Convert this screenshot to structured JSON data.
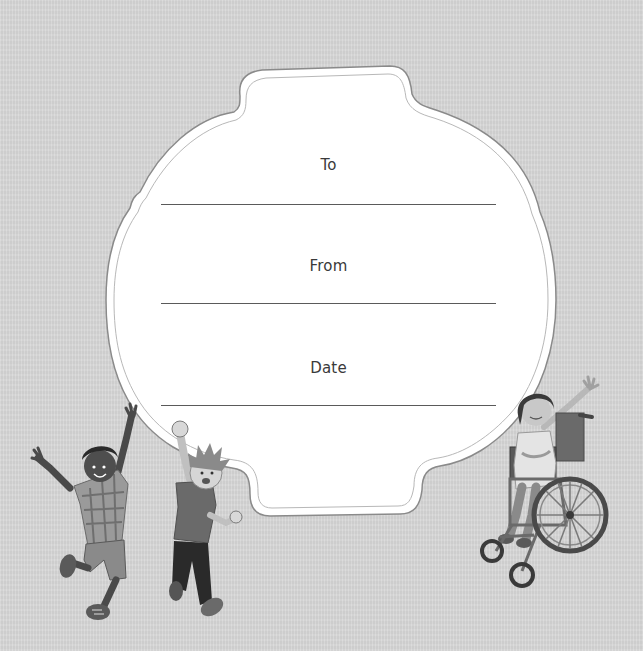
{
  "card": {
    "fields": [
      {
        "label": "To",
        "value": ""
      },
      {
        "label": "From",
        "value": ""
      },
      {
        "label": "Date",
        "value": ""
      }
    ]
  },
  "illustrations": [
    {
      "name": "boy-plaid-shirt-jumping"
    },
    {
      "name": "boy-red-shirt-fist-raised"
    },
    {
      "name": "girl-in-wheelchair-waving"
    }
  ],
  "colors": {
    "background": "#d6d6d6",
    "card_fill": "#ffffff",
    "text": "#3a3a3a",
    "line": "#5a5a5a"
  }
}
